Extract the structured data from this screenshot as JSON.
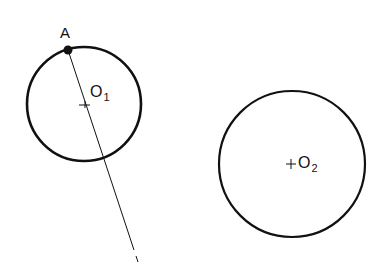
{
  "diagram": {
    "labels": {
      "point_a": "A",
      "center1": "O",
      "center1_sub": "1",
      "center2": "O",
      "center2_sub": "2",
      "line": "l"
    },
    "circles": [
      {
        "name": "O1",
        "cx": 84,
        "cy": 104,
        "r": 57
      },
      {
        "name": "O2",
        "cx": 292,
        "cy": 164,
        "r": 73
      }
    ],
    "point_a": {
      "x": 68,
      "y": 50
    },
    "line_l": {
      "x1": 68,
      "y1": 50,
      "x2": 138,
      "y2": 262
    },
    "colors": {
      "stroke": "#111111",
      "background": "#ffffff"
    }
  }
}
